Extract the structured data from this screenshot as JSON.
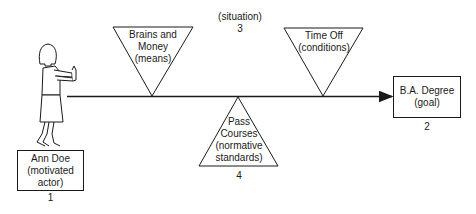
{
  "diagram": {
    "actor": {
      "lines": [
        "Ann Doe",
        "(motivated",
        "actor)"
      ],
      "number": "1"
    },
    "goal": {
      "lines": [
        "B.A. Degree",
        "(goal)"
      ],
      "number": "2"
    },
    "situation": {
      "label": "(situation)",
      "number": "3"
    },
    "means": {
      "lines": [
        "Brains and",
        "Money",
        "(means)"
      ]
    },
    "conditions": {
      "lines": [
        "Time Off",
        "(conditions)"
      ]
    },
    "norms": {
      "lines": [
        "Pass",
        "Courses",
        "(normative",
        "standards)"
      ],
      "number": "4"
    },
    "colors": {
      "stroke": "#1a1a1a",
      "background": "#ffffff"
    }
  }
}
